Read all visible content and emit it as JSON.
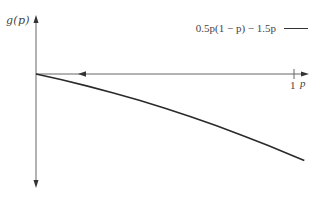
{
  "chart_data": {
    "type": "line",
    "title": "",
    "xlabel": "p",
    "ylabel": "g(p)",
    "x_ticks": [
      "1"
    ],
    "y_ticks": [],
    "grid": false,
    "legend_position": "top-right",
    "legend": [
      "0.5p(1 − p) − 1.5p"
    ],
    "series": [
      {
        "name": "0.5p(1 − p) − 1.5p",
        "formula": "g(p) = 0.5p(1 - p) - 1.5p",
        "x": [
          0,
          0.1,
          0.2,
          0.3,
          0.4,
          0.5,
          0.6,
          0.7,
          0.8,
          0.9,
          1.0,
          1.04
        ],
        "values": [
          0,
          -0.105,
          -0.22,
          -0.345,
          -0.48,
          -0.625,
          -0.78,
          -0.945,
          -1.12,
          -1.305,
          -1.5,
          -1.581
        ]
      }
    ],
    "annotations": [
      "left-pointing arrow on p-axis indicating direction of flow toward p = 0"
    ],
    "xlim": [
      0,
      1.05
    ],
    "ylim": [
      -2.0,
      1.0
    ]
  },
  "labels": {
    "ylabel": "g(p)",
    "xlabel": "p",
    "tick_one": "1",
    "legend": "0.5p(1 − p) − 1.5p"
  },
  "colors": {
    "curve": "#2a2a2a",
    "axis": "#555555",
    "text": "#444444"
  }
}
